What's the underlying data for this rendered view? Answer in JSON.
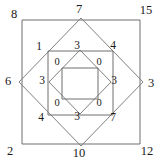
{
  "figure": {
    "stroke_color": "#6e6e6e",
    "text_color": "#1a1a1a",
    "background": "#ffffff"
  },
  "outer_square": {
    "name": "outer-square",
    "corners": [
      {
        "position": "top-left",
        "label": "8",
        "x": 14,
        "y": 14
      },
      {
        "position": "top-right",
        "label": "15",
        "x": 146,
        "y": 10
      },
      {
        "position": "bottom-left",
        "label": "2",
        "x": 10,
        "y": 151
      },
      {
        "position": "bottom-right",
        "label": "12",
        "x": 147,
        "y": 151
      }
    ]
  },
  "outer_diamond": {
    "name": "outer-diamond",
    "vertices": [
      {
        "position": "top",
        "label": "7",
        "x": 79,
        "y": 9
      },
      {
        "position": "right",
        "label": "3",
        "x": 151,
        "y": 83
      },
      {
        "position": "bottom",
        "label": "10",
        "x": 79,
        "y": 153
      },
      {
        "position": "left",
        "label": "6",
        "x": 8,
        "y": 81
      }
    ]
  },
  "middle_square": {
    "name": "middle-square",
    "corners": [
      {
        "position": "top-left",
        "label": "1",
        "x": 39,
        "y": 47
      },
      {
        "position": "top-right",
        "label": "4",
        "x": 113,
        "y": 46
      },
      {
        "position": "bottom-left",
        "label": "4",
        "x": 41,
        "y": 118
      },
      {
        "position": "bottom-right",
        "label": "7",
        "x": 113,
        "y": 118
      }
    ]
  },
  "middle_diamond": {
    "name": "middle-diamond",
    "vertices": [
      {
        "position": "top",
        "label": "3",
        "x": 77,
        "y": 46
      },
      {
        "position": "right",
        "label": "3",
        "x": 114,
        "y": 81
      },
      {
        "position": "bottom",
        "label": "3",
        "x": 77,
        "y": 117
      },
      {
        "position": "left",
        "label": "3",
        "x": 42,
        "y": 81
      }
    ]
  },
  "inner_square": {
    "name": "inner-square",
    "corners": [
      {
        "position": "top-left",
        "label": "0",
        "x": 57,
        "y": 62
      },
      {
        "position": "top-right",
        "label": "0",
        "x": 99,
        "y": 62
      },
      {
        "position": "bottom-left",
        "label": "0",
        "x": 57,
        "y": 103
      },
      {
        "position": "bottom-right",
        "label": "0",
        "x": 99,
        "y": 103
      }
    ]
  },
  "geometry": {
    "outer_square_path": "M 22 20 L 140 20 L 140 144 L 22 144 Z",
    "outer_diamond_path": "M 81 18 L 143 82 L 81 146 L 19 82 Z",
    "middle_square_path": "M 48 51 L 113 51 L 113 115 L 48 115 Z",
    "middle_diamond_path": "M 80 50 L 111 82 L 80 114 L 49 82 Z",
    "inner_square_path": "M 62 68 L 98 68 L 98 99 L 62 99 Z"
  }
}
